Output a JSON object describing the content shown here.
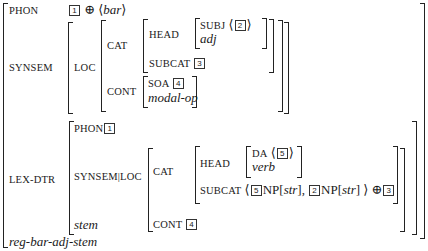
{
  "avm": {
    "type": "reg-bar-adj-stem",
    "phon": {
      "label": "PHON",
      "tag": "1",
      "op": "⊕",
      "open": "⟨",
      "value": "bar",
      "close": "⟩"
    },
    "synsem": {
      "label": "SYNSEM",
      "loc_label": "LOC",
      "cat_label": "CAT",
      "head_label": "HEAD",
      "subj_label": "SUBJ",
      "subj_open": "⟨",
      "subj_tag": "2",
      "subj_close": "⟩",
      "head_type": "adj",
      "subcat_label": "SUBCAT",
      "subcat_tag": "3",
      "cont_label": "CONT",
      "soa_label": "SOA",
      "soa_tag": "4",
      "cont_type": "modal-op"
    },
    "lex_dtr": {
      "label": "LEX-DTR",
      "phon_label": "PHON",
      "phon_tag": "1",
      "synsem_loc_label": "SYNSEM|LOC",
      "cat_label": "CAT",
      "head_label": "HEAD",
      "da_label": "DA",
      "da_open": "⟨",
      "da_tag": "5",
      "da_close": "⟩",
      "head_type": "verb",
      "subcat_label": "SUBCAT",
      "subcat_open": "⟨",
      "subcat_tag1": "5",
      "np1": "NP[",
      "case1": "str",
      "np1_close": "],",
      "subcat_tag2": "2",
      "np2": "NP[",
      "case2": "str",
      "np2_close": "]",
      "subcat_close": "⟩",
      "subcat_op": "⊕",
      "subcat_tag3": "3",
      "cont_label": "CONT",
      "cont_tag": "4",
      "type": "stem"
    }
  }
}
